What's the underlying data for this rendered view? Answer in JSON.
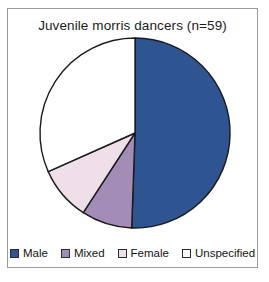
{
  "chart_data": {
    "type": "pie",
    "title": "Juvenile morris dancers (n=59)",
    "total": 59,
    "categories": [
      "Male",
      "Mixed",
      "Female",
      "Unspecified"
    ],
    "values": [
      30,
      5,
      5,
      19
    ],
    "percentages": [
      50.8,
      8.5,
      8.5,
      32.2
    ],
    "angles_deg": [
      182,
      31,
      33,
      114
    ],
    "colors": [
      "#2e5491",
      "#a38cb5",
      "#eedfe8",
      "#ffffff"
    ],
    "slice_border_color": "#1a1a1a",
    "start_angle_deg": 0,
    "direction": "clockwise",
    "legend_position": "bottom",
    "xlabel": "",
    "ylabel": "",
    "grid": false
  },
  "frame": {
    "border_color": "#9a9a9a",
    "background": "#ffffff"
  },
  "legend": {
    "items": [
      {
        "label": "Male",
        "color": "#2e5491"
      },
      {
        "label": "Mixed",
        "color": "#a38cb5"
      },
      {
        "label": "Female",
        "color": "#eedfe8"
      },
      {
        "label": "Unspecified",
        "color": "#ffffff"
      }
    ]
  }
}
